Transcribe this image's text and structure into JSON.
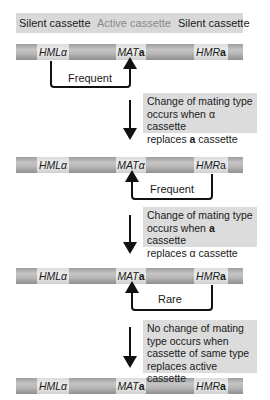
{
  "legend": {
    "left": "Silent cassette",
    "middle": "Active cassette",
    "right": "Silent cassette"
  },
  "chromosomes": [
    {
      "hml": {
        "locus": "HML",
        "allele": "α"
      },
      "mat": {
        "locus": "MAT",
        "allele": "a"
      },
      "hmr": {
        "locus": "HMR",
        "allele": "a"
      }
    },
    {
      "hml": {
        "locus": "HML",
        "allele": "α"
      },
      "mat": {
        "locus": "MAT",
        "allele": "α"
      },
      "hmr": {
        "locus": "HMR",
        "allele": "a"
      }
    },
    {
      "hml": {
        "locus": "HML",
        "allele": "α"
      },
      "mat": {
        "locus": "MAT",
        "allele": "a"
      },
      "hmr": {
        "locus": "HMR",
        "allele": "a"
      }
    },
    {
      "hml": {
        "locus": "HML",
        "allele": "α"
      },
      "mat": {
        "locus": "MAT",
        "allele": "a"
      },
      "hmr": {
        "locus": "HMR",
        "allele": "a"
      }
    }
  ],
  "transfers": [
    {
      "label": "Frequent",
      "from": "HMLα",
      "to": "MAT"
    },
    {
      "label": "Frequent",
      "from": "HMRa",
      "to": "MAT"
    },
    {
      "label": "Rare",
      "from": "HMRa",
      "to": "MAT"
    }
  ],
  "notes": [
    {
      "line1": "Change of mating type",
      "line2a": "occurs when ",
      "line2b": "α",
      "line2c": " cassette",
      "line3a": "replaces ",
      "line3b": "a",
      "line3c": " cassette"
    },
    {
      "line1": "Change of mating type",
      "line2a": "occurs when ",
      "line2b": "a",
      "line2c": " cassette",
      "line3a": "replaces ",
      "line3b": "α",
      "line3c": " cassette"
    },
    {
      "line1": "No change of mating",
      "line2": "type occurs when",
      "line3": "cassette of same type",
      "line4": "replaces active cassette"
    }
  ],
  "colors": {
    "chromosome": "#b0b0b0",
    "cassette": "#e6e6e6",
    "note_box": "#dcdcdc",
    "arrow": "#111111"
  }
}
